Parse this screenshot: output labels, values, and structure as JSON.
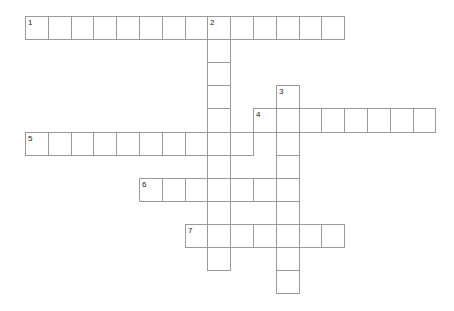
{
  "puzzle": {
    "type": "crossword",
    "grid_origin": {
      "x": 25,
      "y": 16
    },
    "cell_size": {
      "w": 22.8,
      "h": 23.1
    },
    "border_color": "#9a9a9a",
    "number_color": "#222222",
    "entries": [
      {
        "number": "1",
        "direction": "across",
        "row": 0,
        "col": 0,
        "length": 14
      },
      {
        "number": "2",
        "direction": "down",
        "row": 0,
        "col": 8,
        "length": 11
      },
      {
        "number": "3",
        "direction": "down",
        "row": 3,
        "col": 11,
        "length": 9
      },
      {
        "number": "4",
        "direction": "across",
        "row": 4,
        "col": 10,
        "length": 8
      },
      {
        "number": "5",
        "direction": "across",
        "row": 5,
        "col": 0,
        "length": 10
      },
      {
        "number": "6",
        "direction": "across",
        "row": 7,
        "col": 5,
        "length": 7
      },
      {
        "number": "7",
        "direction": "across",
        "row": 9,
        "col": 7,
        "length": 7
      }
    ]
  }
}
